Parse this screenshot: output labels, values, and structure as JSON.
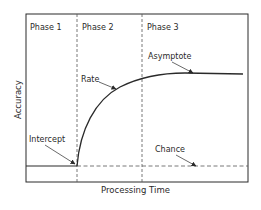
{
  "diagram": {
    "phases": [
      {
        "label": "Phase 1"
      },
      {
        "label": "Phase 2"
      },
      {
        "label": "Phase 3"
      }
    ],
    "annotations": {
      "rate": "Rate",
      "asymptote": "Asymptote",
      "intercept": "Intercept",
      "chance": "Chance"
    },
    "axes": {
      "x_label": "Processing Time",
      "y_label": "Accuracy"
    },
    "colors": {
      "line": "#2a2a2a",
      "dashed": "#555555",
      "background": "#ffffff"
    }
  }
}
